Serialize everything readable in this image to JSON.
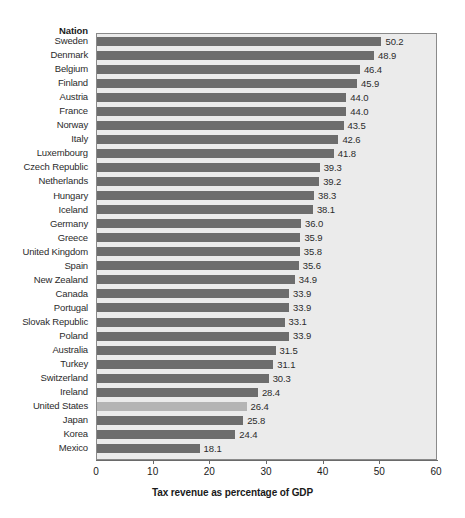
{
  "header": {
    "category_header": "Nation"
  },
  "axis": {
    "title": "Tax revenue as percentage of GDP",
    "ticks": [
      "0",
      "10",
      "20",
      "30",
      "40",
      "50",
      "60"
    ]
  },
  "colors": {
    "bar": "#6d6d6d",
    "bar_highlight": "#b4b4b4",
    "plot_background": "#ebebeb",
    "frame": "#8a8a8a",
    "text": "#2b2b2b"
  },
  "chart_data": {
    "type": "bar",
    "orientation": "horizontal",
    "title": "",
    "xlabel": "Tax revenue as percentage of GDP",
    "ylabel": "Nation",
    "xlim": [
      0,
      60
    ],
    "xticks": [
      0,
      10,
      20,
      30,
      40,
      50,
      60
    ],
    "grid": false,
    "legend": "none",
    "highlight_category": "United States",
    "categories": [
      "Sweden",
      "Denmark",
      "Belgium",
      "Finland",
      "Austria",
      "France",
      "Norway",
      "Italy",
      "Luxembourg",
      "Czech Republic",
      "Netherlands",
      "Hungary",
      "Iceland",
      "Germany",
      "Greece",
      "United Kingdom",
      "Spain",
      "New Zealand",
      "Canada",
      "Portugal",
      "Slovak Republic",
      "Poland",
      "Australia",
      "Turkey",
      "Switzerland",
      "Ireland",
      "United States",
      "Japan",
      "Korea",
      "Mexico"
    ],
    "values": [
      50.2,
      48.9,
      46.4,
      45.9,
      44.0,
      44.0,
      43.5,
      42.6,
      41.8,
      39.3,
      39.2,
      38.3,
      38.1,
      36.0,
      35.9,
      35.8,
      35.6,
      34.9,
      33.9,
      33.9,
      33.1,
      33.9,
      31.5,
      31.1,
      30.3,
      28.4,
      26.4,
      25.8,
      24.4,
      18.1
    ],
    "value_labels": [
      "50.2",
      "48.9",
      "46.4",
      "45.9",
      "44.0",
      "44.0",
      "43.5",
      "42.6",
      "41.8",
      "39.3",
      "39.2",
      "38.3",
      "38.1",
      "36.0",
      "35.9",
      "35.8",
      "35.6",
      "34.9",
      "33.9",
      "33.9",
      "33.1",
      "33.9",
      "31.5",
      "31.1",
      "30.3",
      "28.4",
      "26.4",
      "25.8",
      "24.4",
      "18.1"
    ]
  }
}
